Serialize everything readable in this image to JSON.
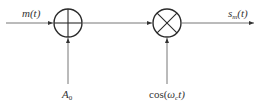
{
  "diagram": {
    "colors": {
      "line": "#555555",
      "block": "#2a2a2a",
      "text": "#333333",
      "background": "#ffffff"
    },
    "inputs": {
      "message": {
        "label": "m(t)",
        "base": "m",
        "arg": "(t)"
      },
      "dc_offset": {
        "label": "A0",
        "base": "A",
        "sub": "0"
      },
      "carrier": {
        "label": "cos(ωct)",
        "pre": "cos(",
        "omega": "ω",
        "sub": "c",
        "post": "t)"
      }
    },
    "blocks": [
      {
        "id": "adder",
        "symbol": "plus-circle",
        "type": "summing-junction"
      },
      {
        "id": "multiplier",
        "symbol": "x-circle",
        "type": "multiplier"
      }
    ],
    "output": {
      "label": "sm(t)",
      "base": "s",
      "sub": "m",
      "arg": "(t)"
    }
  }
}
